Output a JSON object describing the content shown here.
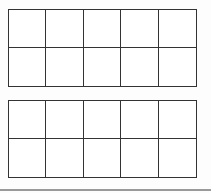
{
  "diagram": {
    "type": "ten-frames",
    "frames": [
      {
        "rows": 2,
        "cols": 5,
        "filled": 0,
        "box": {
          "x": 8,
          "y": 9,
          "w": 189,
          "h": 78
        }
      },
      {
        "rows": 2,
        "cols": 5,
        "filled": 0,
        "box": {
          "x": 8,
          "y": 100,
          "w": 189,
          "h": 78
        }
      }
    ],
    "line_color": "#333333",
    "rule_color": "#9a9a9a"
  }
}
